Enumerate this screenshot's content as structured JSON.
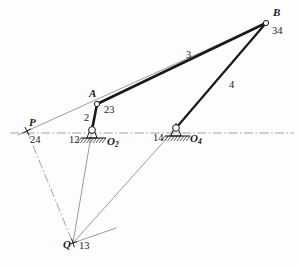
{
  "figure": {
    "kind": "four-bar-linkage-instant-center-diagram",
    "background_color": "#fdfdfd",
    "ink_color": "#191919",
    "construction_color": "#7a7a7a",
    "ground_color": "#8c8c8c"
  },
  "points": {
    "A": {
      "label": "A",
      "x": 97,
      "y": 104
    },
    "B": {
      "label": "B",
      "x": 266,
      "y": 23
    },
    "P": {
      "label": "P",
      "x": 27,
      "y": 131
    },
    "Q": {
      "label": "Q",
      "x": 73,
      "y": 243
    },
    "O2": {
      "label": "O",
      "sub": "2",
      "x": 92,
      "y": 130
    },
    "O4": {
      "label": "O",
      "sub": "4",
      "x": 176,
      "y": 128
    }
  },
  "instant_centers": [
    {
      "name": "ic-23",
      "label": "23",
      "x": 104,
      "y": 105
    },
    {
      "name": "ic-34",
      "label": "34",
      "x": 272,
      "y": 26
    },
    {
      "name": "ic-24",
      "label": "24",
      "x": 30,
      "y": 135
    },
    {
      "name": "ic-12",
      "label": "12",
      "x": 69,
      "y": 135
    },
    {
      "name": "ic-14",
      "label": "14",
      "x": 153,
      "y": 133
    },
    {
      "name": "ic-13",
      "label": "13",
      "x": 79,
      "y": 241
    }
  ],
  "link_labels": [
    {
      "name": "link-2",
      "label": "2",
      "x": 84,
      "y": 113
    },
    {
      "name": "link-3",
      "label": "3",
      "x": 186,
      "y": 50
    },
    {
      "name": "link-4",
      "label": "4",
      "x": 229,
      "y": 80
    }
  ],
  "pivot_labels": [
    {
      "name": "pivot-label-o2",
      "label": "O",
      "sub": "2",
      "x": 107,
      "y": 136
    },
    {
      "name": "pivot-label-o4",
      "label": "O",
      "sub": "4",
      "x": 190,
      "y": 133
    }
  ],
  "heavy_links": [
    {
      "name": "link-ab-coupler",
      "x1": 97,
      "y1": 104,
      "x2": 266,
      "y2": 23,
      "width": 2.6
    },
    {
      "name": "link-bo4-rocker",
      "x1": 266,
      "y1": 23,
      "x2": 176,
      "y2": 128,
      "width": 2.2
    },
    {
      "name": "link-ao2-crank",
      "x1": 97,
      "y1": 104,
      "x2": 92,
      "y2": 130,
      "width": 2.6
    }
  ],
  "construction_lines": [
    {
      "name": "line-p-to-b-through-a",
      "x1": 18,
      "y1": 135,
      "x2": 266,
      "y2": 23
    },
    {
      "name": "line-o2-to-q",
      "x1": 92,
      "y1": 130,
      "x2": 73,
      "y2": 243
    },
    {
      "name": "line-o4-to-q",
      "x1": 176,
      "y1": 128,
      "x2": 73,
      "y2": 243
    },
    {
      "name": "line-q-short-stub-right",
      "x1": 73,
      "y1": 243,
      "x2": 116,
      "y2": 228
    }
  ],
  "dash_dot_lines": [
    {
      "name": "ground-centerline",
      "x1": 10,
      "y1": 133,
      "x2": 294,
      "y2": 133
    },
    {
      "name": "line-p-to-q-dashdot",
      "x1": 27,
      "y1": 131,
      "x2": 73,
      "y2": 243
    }
  ],
  "cross_marks": [
    {
      "name": "cross-mark-p",
      "x": 27,
      "y": 131,
      "size": 9,
      "angle": 62
    },
    {
      "name": "cross-mark-q",
      "x": 73,
      "y": 243,
      "size": 9,
      "angle": 72
    }
  ],
  "joints": [
    {
      "name": "joint-a-pin",
      "x": 97,
      "y": 104,
      "r": 2.6
    },
    {
      "name": "joint-b-pin",
      "x": 266,
      "y": 23,
      "r": 2.6
    }
  ],
  "ground_pivots": [
    {
      "name": "ground-pivot-o2",
      "cx": 92,
      "cy": 130,
      "r": 3.4,
      "base_x1": 81,
      "base_x2": 106,
      "base_y": 138,
      "hatch_count": 9,
      "hatch_len": 5
    },
    {
      "name": "ground-pivot-o4",
      "cx": 176,
      "cy": 128,
      "r": 3.4,
      "base_x1": 165,
      "base_x2": 190,
      "base_y": 136,
      "hatch_count": 9,
      "hatch_len": 5
    }
  ]
}
